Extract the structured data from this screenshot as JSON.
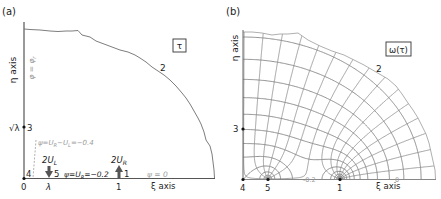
{
  "figure": {
    "panels": [
      {
        "id": "a",
        "label": "(a)",
        "box_label": "τ",
        "xaxis_label": "ξ axis",
        "yaxis_label": "η axis",
        "origin_px": [
          24,
          178
        ],
        "unit_px": 95,
        "ticks": {
          "x0": "0",
          "lambda": "λ",
          "one": "1",
          "sqrt_lambda": "√λ"
        },
        "points": {
          "p1": "1",
          "p2": "2",
          "p3": "3",
          "p4": "4",
          "p5": "5"
        },
        "annotations": {
          "phi": "φ = φ_r",
          "psi_top": "ψ=U_R−U_L=−0.4",
          "psi_mid": "ψ=U_R=−0.2",
          "psi_zero": "ψ = 0",
          "src_left": "2U_L",
          "src_right": "2U_R"
        }
      },
      {
        "id": "b",
        "label": "(b)",
        "box_label": "ω(τ)",
        "xaxis_label": "ξ axis",
        "yaxis_label": "η axis",
        "origin_px": [
          243,
          179
        ],
        "unit_px": 97,
        "points": {
          "p1": "1",
          "p2": "2",
          "p3": "3",
          "p4": "4",
          "p5": "5"
        },
        "contour_labels": [
          "-0.2",
          "0",
          "-0.4",
          "-0.1",
          "0.1",
          "0.2"
        ]
      }
    ],
    "colors": {
      "axis": "#555555",
      "grid": "#8a8a8a",
      "boundary": "#707070",
      "text": "#222222",
      "faint": "#a0a0a0"
    }
  }
}
